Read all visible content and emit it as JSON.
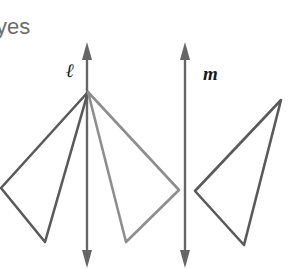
{
  "answer": {
    "text": "yes"
  },
  "lines": [
    {
      "id": "l",
      "label": "ℓ",
      "x": 87,
      "y_top": 42,
      "y_bottom": 268
    },
    {
      "id": "m",
      "label": "m",
      "x": 185,
      "y_top": 42,
      "y_bottom": 268
    }
  ],
  "triangles": [
    {
      "id": "original",
      "points": [
        [
          88,
          92
        ],
        [
          1,
          188
        ],
        [
          45,
          242
        ]
      ],
      "color": "#5a5a5a"
    },
    {
      "id": "reflection-over-l",
      "points": [
        [
          88,
          92
        ],
        [
          179,
          190
        ],
        [
          126,
          242
        ]
      ],
      "color": "#8e8e8e"
    },
    {
      "id": "reflection-over-m",
      "points": [
        [
          281,
          100
        ],
        [
          195,
          191
        ],
        [
          244,
          245
        ]
      ],
      "color": "#5a5a5a"
    }
  ],
  "colors": {
    "line": "#666666",
    "dark_triangle": "#5a5a5a",
    "light_triangle": "#8e8e8e",
    "text": "#6d6d6d"
  }
}
